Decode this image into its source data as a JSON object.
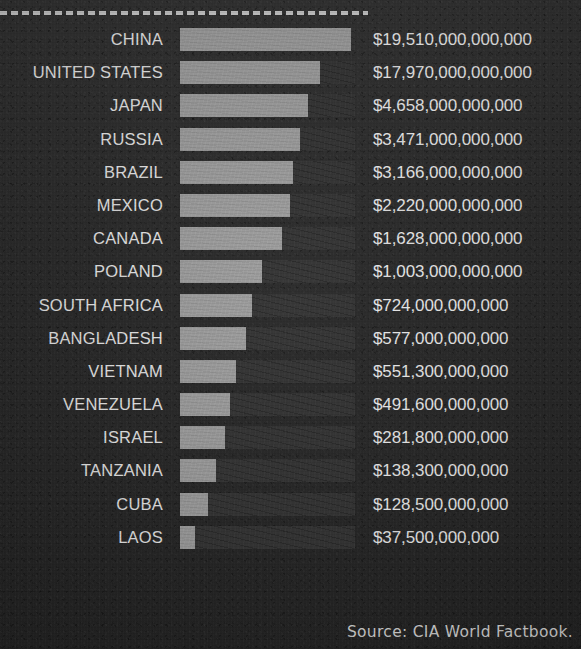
{
  "footer": {
    "source_note": "Source: CIA World Factbook."
  },
  "chart_data": {
    "type": "bar",
    "orientation": "horizontal",
    "title": "",
    "xlabel": "",
    "ylabel": "",
    "grid": false,
    "legend": "none",
    "value_prefix": "$",
    "bar_color": "#9d9d9d",
    "track_color": "#343434",
    "background_color": "#2c2c2c",
    "text_color": "#e8e8e8",
    "categories": [
      "CHINA",
      "UNITED STATES",
      "JAPAN",
      "RUSSIA",
      "BRAZIL",
      "MEXICO",
      "CANADA",
      "POLAND",
      "SOUTH AFRICA",
      "BANGLADESH",
      "VIETNAM",
      "VENEZUELA",
      "ISRAEL",
      "TANZANIA",
      "CUBA",
      "LAOS"
    ],
    "values": [
      19510000000000,
      17970000000000,
      4658000000000,
      3471000000000,
      3166000000000,
      2220000000000,
      1628000000000,
      1003000000000,
      724000000000,
      577000000000,
      551300000000,
      491600000000,
      281800000000,
      138300000000,
      128500000000,
      37500000000
    ],
    "value_labels": [
      "$19,510,000,000,000",
      "$17,970,000,000,000",
      "$4,658,000,000,000",
      "$3,471,000,000,000",
      "$3,166,000,000,000",
      "$2,220,000,000,000",
      "$1,628,000,000,000",
      "$1,003,000,000,000",
      "$724,000,000,000",
      "$577,000,000,000",
      "$551,300,000,000",
      "$491,600,000,000",
      "$281,800,000,000",
      "$138,300,000,000",
      "$128,500,000,000",
      "$37,500,000,000"
    ],
    "bar_pixel_widths": [
      171,
      140,
      128,
      120,
      113,
      110,
      102,
      82,
      72,
      66,
      56,
      50,
      45,
      36,
      28,
      15
    ],
    "track_pixel_width": 175,
    "rows": [
      {
        "label": "CHINA",
        "value_label": "$19,510,000,000,000",
        "value": 19510000000000,
        "bar_width": 171
      },
      {
        "label": "UNITED STATES",
        "value_label": "$17,970,000,000,000",
        "value": 17970000000000,
        "bar_width": 140
      },
      {
        "label": "JAPAN",
        "value_label": "$4,658,000,000,000",
        "value": 4658000000000,
        "bar_width": 128
      },
      {
        "label": "RUSSIA",
        "value_label": "$3,471,000,000,000",
        "value": 3471000000000,
        "bar_width": 120
      },
      {
        "label": "BRAZIL",
        "value_label": "$3,166,000,000,000",
        "value": 3166000000000,
        "bar_width": 113
      },
      {
        "label": "MEXICO",
        "value_label": "$2,220,000,000,000",
        "value": 2220000000000,
        "bar_width": 110
      },
      {
        "label": "CANADA",
        "value_label": "$1,628,000,000,000",
        "value": 1628000000000,
        "bar_width": 102
      },
      {
        "label": "POLAND",
        "value_label": "$1,003,000,000,000",
        "value": 1003000000000,
        "bar_width": 82
      },
      {
        "label": "SOUTH AFRICA",
        "value_label": "$724,000,000,000",
        "value": 724000000000,
        "bar_width": 72
      },
      {
        "label": "BANGLADESH",
        "value_label": "$577,000,000,000",
        "value": 577000000000,
        "bar_width": 66
      },
      {
        "label": "VIETNAM",
        "value_label": "$551,300,000,000",
        "value": 551300000000,
        "bar_width": 56
      },
      {
        "label": "VENEZUELA",
        "value_label": "$491,600,000,000",
        "value": 491600000000,
        "bar_width": 50
      },
      {
        "label": "ISRAEL",
        "value_label": "$281,800,000,000",
        "value": 281800000000,
        "bar_width": 45
      },
      {
        "label": "TANZANIA",
        "value_label": "$138,300,000,000",
        "value": 138300000000,
        "bar_width": 36
      },
      {
        "label": "CUBA",
        "value_label": "$128,500,000,000",
        "value": 128500000000,
        "bar_width": 28
      },
      {
        "label": "LAOS",
        "value_label": "$37,500,000,000",
        "value": 37500000000,
        "bar_width": 15
      }
    ]
  }
}
